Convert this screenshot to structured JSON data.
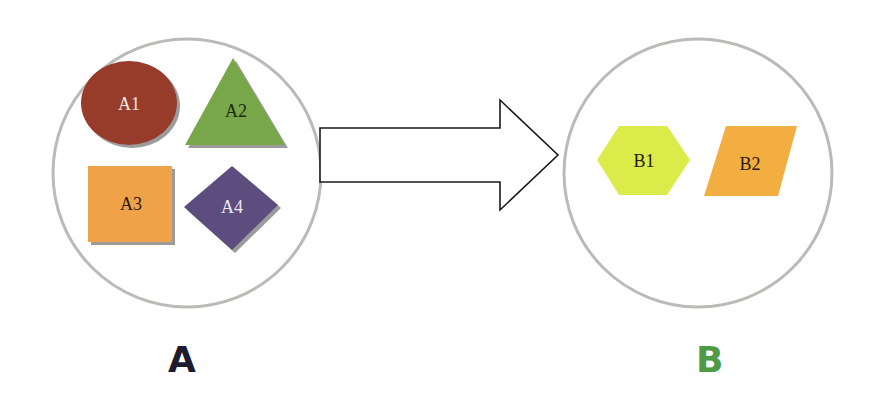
{
  "diagram": {
    "type": "transformation",
    "group_a": {
      "label": "A",
      "label_color": "#1e1b2e",
      "shapes": [
        {
          "id": "A1",
          "label": "A1",
          "shape": "ellipse",
          "color": "#973a2b",
          "text_color": "#f2e6e0"
        },
        {
          "id": "A2",
          "label": "A2",
          "shape": "triangle",
          "color": "#78a748",
          "text_color": "#1c2a12"
        },
        {
          "id": "A3",
          "label": "A3",
          "shape": "square",
          "color": "#f0a24a",
          "text_color": "#2a1a0a"
        },
        {
          "id": "A4",
          "label": "A4",
          "shape": "diamond",
          "color": "#5d4d7e",
          "text_color": "#ece8f2"
        }
      ]
    },
    "arrow": {
      "direction": "right",
      "style": "outline block arrow"
    },
    "group_b": {
      "label": "B",
      "label_color": "#4e9a45",
      "shapes": [
        {
          "id": "B1",
          "label": "B1",
          "shape": "hexagon",
          "color": "#dcea4a",
          "text_color": "#1e2008"
        },
        {
          "id": "B2",
          "label": "B2",
          "shape": "parallelogram",
          "color": "#f2ae40",
          "text_color": "#2a1a08"
        }
      ]
    }
  }
}
